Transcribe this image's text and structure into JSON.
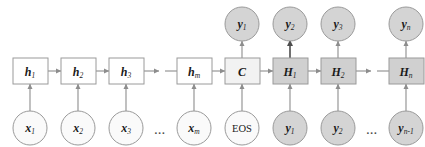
{
  "figure": {
    "colors": {
      "white_fill": "#ffffff",
      "light_fill": "#f2f2f2",
      "gray_fill": "#d0d0d0",
      "circle_light_fill": "#f4f4f4",
      "circle_gray_fill": "#d4d4d4",
      "stroke": "#9a9a9a",
      "arrow": "#8d8d8d",
      "arrow_strong": "#4d4d4d",
      "text": "#1a1a1a",
      "background": "#ffffff"
    },
    "ellipsis": "..."
  },
  "encoder": {
    "hidden_states": [
      {
        "base": "h",
        "sub": "1",
        "label": "h1"
      },
      {
        "base": "h",
        "sub": "2",
        "label": "h2"
      },
      {
        "base": "h",
        "sub": "3",
        "label": "h3"
      },
      {
        "base": "h",
        "sub": "m",
        "label": "hm"
      }
    ],
    "inputs": [
      {
        "base": "x",
        "sub": "1",
        "label": "x1"
      },
      {
        "base": "x",
        "sub": "2",
        "label": "x2"
      },
      {
        "base": "x",
        "sub": "3",
        "label": "x3"
      },
      {
        "base": "x",
        "sub": "m",
        "label": "xm"
      }
    ],
    "input_ellipsis": "..."
  },
  "context": {
    "box": {
      "base": "C",
      "sub": "",
      "label": "C"
    },
    "token": {
      "base": "EOS",
      "sub": "",
      "label": "EOS"
    }
  },
  "decoder": {
    "hidden_states": [
      {
        "base": "H",
        "sub": "1",
        "label": "H1"
      },
      {
        "base": "H",
        "sub": "2",
        "label": "H2"
      },
      {
        "base": "H",
        "sub": "n",
        "label": "Hn"
      }
    ],
    "outputs": [
      {
        "base": "y",
        "sub": "1",
        "label": "y1"
      },
      {
        "base": "y",
        "sub": "2",
        "label": "y2"
      },
      {
        "base": "y",
        "sub": "3",
        "label": "y3"
      },
      {
        "base": "y",
        "sub": "n",
        "label": "yn"
      }
    ],
    "fed_inputs": [
      {
        "base": "y",
        "sub": "1",
        "label": "y1"
      },
      {
        "base": "y",
        "sub": "2",
        "label": "y2"
      },
      {
        "base": "y",
        "sub": "n-1",
        "label": "yn-1"
      }
    ],
    "hidden_ellipsis": "...",
    "input_ellipsis": "..."
  }
}
